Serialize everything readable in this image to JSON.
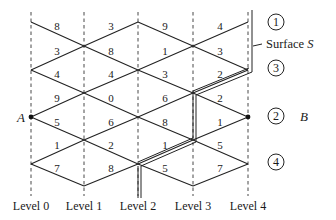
{
  "diagram": {
    "levels": [
      {
        "label": "Level 0",
        "x": 31
      },
      {
        "label": "Level 1",
        "x": 84
      },
      {
        "label": "Level 2",
        "x": 138
      },
      {
        "label": "Level 3",
        "x": 193
      },
      {
        "label": "Level 4",
        "x": 248
      }
    ],
    "weights": [
      {
        "value": "8",
        "x": 57,
        "y": 30
      },
      {
        "value": "3",
        "x": 111,
        "y": 30
      },
      {
        "value": "9",
        "x": 165,
        "y": 30
      },
      {
        "value": "4",
        "x": 220,
        "y": 30
      },
      {
        "value": "3",
        "x": 57,
        "y": 55
      },
      {
        "value": "8",
        "x": 111,
        "y": 55
      },
      {
        "value": "1",
        "x": 165,
        "y": 55
      },
      {
        "value": "3",
        "x": 220,
        "y": 55
      },
      {
        "value": "4",
        "x": 57,
        "y": 78
      },
      {
        "value": "4",
        "x": 111,
        "y": 78
      },
      {
        "value": "3",
        "x": 165,
        "y": 78
      },
      {
        "value": "2",
        "x": 220,
        "y": 78
      },
      {
        "value": "9",
        "x": 57,
        "y": 102
      },
      {
        "value": "0",
        "x": 111,
        "y": 102
      },
      {
        "value": "6",
        "x": 165,
        "y": 102
      },
      {
        "value": "2",
        "x": 220,
        "y": 102
      },
      {
        "value": "5",
        "x": 57,
        "y": 126
      },
      {
        "value": "6",
        "x": 111,
        "y": 126
      },
      {
        "value": "8",
        "x": 165,
        "y": 126
      },
      {
        "value": "1",
        "x": 220,
        "y": 126
      },
      {
        "value": "1",
        "x": 57,
        "y": 149
      },
      {
        "value": "2",
        "x": 111,
        "y": 149
      },
      {
        "value": "1",
        "x": 165,
        "y": 149
      },
      {
        "value": "5",
        "x": 220,
        "y": 149
      },
      {
        "value": "7",
        "x": 57,
        "y": 172
      },
      {
        "value": "8",
        "x": 111,
        "y": 172
      },
      {
        "value": "5",
        "x": 165,
        "y": 172
      },
      {
        "value": "7",
        "x": 220,
        "y": 172
      }
    ],
    "regions": [
      {
        "label": "1",
        "x": 276,
        "y": 22
      },
      {
        "label": "3",
        "x": 276,
        "y": 68
      },
      {
        "label": "2",
        "x": 276,
        "y": 116
      },
      {
        "label": "4",
        "x": 276,
        "y": 162
      }
    ],
    "node_a": {
      "label": "A"
    },
    "node_b": {
      "label": "B"
    },
    "surface_label": "Surface S"
  }
}
